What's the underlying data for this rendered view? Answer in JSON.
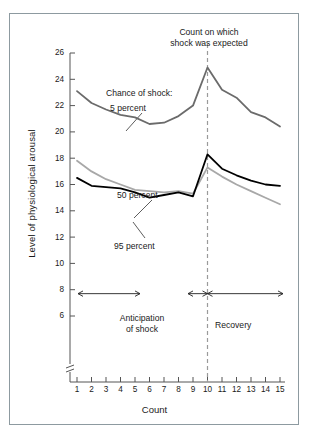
{
  "figure": {
    "background": "#ffffff",
    "border_color": "#8d9aa0"
  },
  "labels": {
    "expected_line": "Count on which\nshock was expected",
    "chance_of_shock": "Chance of shock:",
    "series_5": "5 percent",
    "series_50": "50 percent",
    "series_95": "95 percent",
    "anticipation": "Anticipation\nof shock",
    "recovery": "Recovery"
  },
  "chart_data": {
    "type": "line",
    "title": "",
    "xlabel": "Count",
    "ylabel": "Level of physiological arousal",
    "x": [
      1,
      2,
      3,
      4,
      5,
      6,
      7,
      8,
      9,
      10,
      11,
      12,
      13,
      14,
      15
    ],
    "xlim": [
      1,
      15
    ],
    "ylim": [
      5.2,
      26
    ],
    "yticks": [
      6,
      8,
      10,
      12,
      14,
      16,
      18,
      20,
      22,
      24,
      26
    ],
    "xticks": [
      1,
      2,
      3,
      4,
      5,
      6,
      7,
      8,
      9,
      10,
      11,
      12,
      13,
      14,
      15
    ],
    "y_axis_break": true,
    "grid": false,
    "legend": "inline annotations",
    "series": [
      {
        "name": "5 percent",
        "color": "#6b6b6b",
        "width": 1.8,
        "values": [
          23.1,
          22.2,
          21.7,
          21.3,
          21.1,
          20.6,
          20.7,
          21.2,
          22.0,
          24.9,
          23.2,
          22.6,
          21.5,
          21.1,
          20.4
        ]
      },
      {
        "name": "50 percent",
        "color": "#a8a8a8",
        "width": 1.8,
        "values": [
          17.8,
          17.0,
          16.4,
          16.0,
          15.6,
          15.5,
          15.4,
          15.5,
          15.3,
          17.3,
          16.6,
          16.0,
          15.5,
          15.0,
          14.5
        ]
      },
      {
        "name": "95 percent",
        "color": "#000000",
        "width": 1.8,
        "values": [
          16.5,
          15.9,
          15.8,
          15.7,
          15.4,
          15.0,
          15.2,
          15.4,
          15.1,
          18.3,
          17.2,
          16.7,
          16.3,
          16.0,
          15.9
        ]
      }
    ],
    "annotations": [
      {
        "name": "expected-shock-line",
        "type": "vline",
        "x": 10,
        "style": "dashed",
        "color": "#9a9a9a"
      },
      {
        "name": "anticipation-span",
        "type": "arrow-span",
        "from": 1,
        "to": 10,
        "label": "Anticipation of shock"
      },
      {
        "name": "recovery-span",
        "type": "arrow-span",
        "from": 10,
        "to": 15,
        "label": "Recovery"
      },
      {
        "name": "leader-5-percent",
        "type": "leader-line"
      },
      {
        "name": "leader-50-percent",
        "type": "leader-line"
      },
      {
        "name": "leader-95-percent",
        "type": "leader-line"
      }
    ]
  }
}
